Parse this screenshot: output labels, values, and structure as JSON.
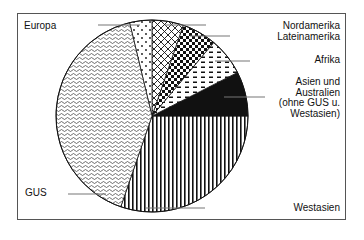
{
  "chart_data": {
    "type": "pie",
    "title": "",
    "start_angle_deg": 0,
    "direction": "counterclockwise",
    "slices": [
      {
        "label": "Westasien",
        "value": 30.3,
        "start_deg": 251,
        "end_deg": 360,
        "pattern": "vertical-stripes"
      },
      {
        "label": "Asien und Australien (ohne GUS u. Westasien)",
        "value": 7.5,
        "start_deg": 0,
        "end_deg": 27,
        "pattern": "solid-black"
      },
      {
        "label": "Afrika",
        "value": 6.4,
        "start_deg": 27,
        "end_deg": 50,
        "pattern": "dashes"
      },
      {
        "label": "Lateinamerika",
        "value": 5.8,
        "start_deg": 50,
        "end_deg": 71,
        "pattern": "checkerboard"
      },
      {
        "label": "Nordamerika",
        "value": 5.3,
        "start_deg": 71,
        "end_deg": 90,
        "pattern": "cross-hatch"
      },
      {
        "label": "Europa",
        "value": 3.8,
        "start_deg": 90,
        "end_deg": 103.5,
        "pattern": "dots"
      },
      {
        "label": "GUS",
        "value": 41.0,
        "start_deg": 103.5,
        "end_deg": 251,
        "pattern": "wavy"
      }
    ],
    "units": "percent (estimated from angles)",
    "legend": "leader-line labels"
  },
  "labels": {
    "europa": "Europa",
    "nordamerika": "Nordamerika",
    "lateinamerika": "Lateinamerika",
    "afrika": "Afrika",
    "asien_lines": [
      "Asien und",
      "Australien",
      "(ohne GUS u.",
      "Westasien)"
    ],
    "gus": "GUS",
    "westasien": "Westasien"
  },
  "colors": {
    "ink": "#111111",
    "leader": "#777777",
    "frame": "#555555",
    "background": "#ffffff"
  }
}
